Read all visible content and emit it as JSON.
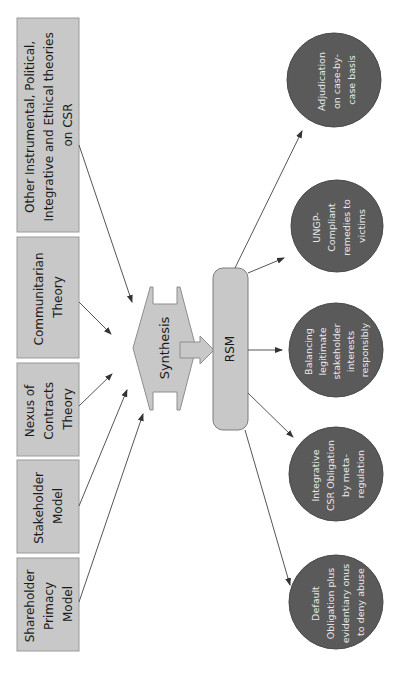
{
  "diagram": {
    "theory_boxes": [
      {
        "id": "other",
        "lines": [
          "Other Instrumental, Political,",
          "Integrative and Ethical theories",
          "on CSR"
        ]
      },
      {
        "id": "communitarian",
        "lines": [
          "Communitarian",
          "Theory"
        ]
      },
      {
        "id": "nexus",
        "lines": [
          "Nexus of",
          "Contracts",
          "Theory"
        ]
      },
      {
        "id": "stakeholder",
        "lines": [
          "Stakeholder",
          "Model"
        ]
      },
      {
        "id": "shareholder",
        "lines": [
          "Shareholder",
          "Primacy",
          "Model"
        ]
      }
    ],
    "synthesis": {
      "label": "Synthesis"
    },
    "rsm": {
      "label": "RSM"
    },
    "outcomes": [
      {
        "id": "adjudication",
        "lines": [
          "Adjudication",
          "on case-by-",
          "case basis"
        ]
      },
      {
        "id": "ungp",
        "lines": [
          "UNGP-",
          "Compliant",
          "remedies to",
          "victims"
        ]
      },
      {
        "id": "balancing",
        "lines": [
          "Balancing",
          "legitimate",
          "stakeholder",
          "interests",
          "responsibly"
        ]
      },
      {
        "id": "integrative",
        "lines": [
          "Integrative",
          "CSR Obligation",
          "by meta-",
          "regulation"
        ]
      },
      {
        "id": "default",
        "lines": [
          "Default",
          "Obligation plus",
          "evidentiary onus",
          "to deny abuse"
        ]
      }
    ],
    "colors": {
      "box_fill": "#c8c8c8",
      "circle_fill": "#5a5a5a",
      "circle_text": "#e8e8e8",
      "arrow": "#555555"
    }
  }
}
